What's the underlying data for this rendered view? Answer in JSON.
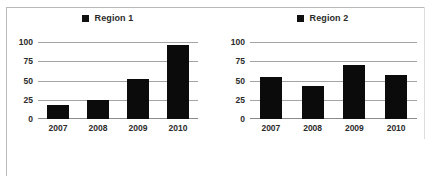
{
  "figure": {
    "background_color": "#ffffff",
    "border_color": "#b9b9b9",
    "bar_color": "#0b0b0b",
    "gridline_color": "#a4a4a4",
    "text_color": "#2b2b2b"
  },
  "charts": [
    {
      "legend_label": "Region 1",
      "legend_marker": "filled-square-icon",
      "ytick_labels": [
        "100",
        "75",
        "50",
        "25",
        "0"
      ],
      "xtick_labels": [
        "2007",
        "2008",
        "2009",
        "2010"
      ]
    },
    {
      "legend_label": "Region 2",
      "legend_marker": "filled-square-icon",
      "ytick_labels": [
        "100",
        "75",
        "50",
        "25",
        "0"
      ],
      "xtick_labels": [
        "2007",
        "2008",
        "2009",
        "2010"
      ]
    }
  ],
  "chart_data": [
    {
      "type": "bar",
      "title": "Region 1",
      "categories": [
        "2007",
        "2008",
        "2009",
        "2010"
      ],
      "values": [
        18,
        25,
        52,
        96
      ],
      "series": [
        {
          "name": "Region 1",
          "values": [
            18,
            25,
            52,
            96
          ]
        }
      ],
      "xlabel": "",
      "ylabel": "",
      "ylim": [
        0,
        100
      ],
      "yticks": [
        0,
        25,
        50,
        75,
        100
      ],
      "grid": true,
      "legend_position": "top-center",
      "bar_color": "#0b0b0b"
    },
    {
      "type": "bar",
      "title": "Region 2",
      "categories": [
        "2007",
        "2008",
        "2009",
        "2010"
      ],
      "values": [
        54,
        43,
        70,
        57
      ],
      "series": [
        {
          "name": "Region 2",
          "values": [
            54,
            43,
            70,
            57
          ]
        }
      ],
      "xlabel": "",
      "ylabel": "",
      "ylim": [
        0,
        100
      ],
      "yticks": [
        0,
        25,
        50,
        75,
        100
      ],
      "grid": true,
      "legend_position": "top-center",
      "bar_color": "#0b0b0b"
    }
  ]
}
